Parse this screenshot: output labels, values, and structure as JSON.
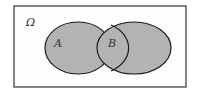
{
  "diagram": {
    "type": "venn",
    "universe_label": "Ω",
    "sets": [
      {
        "label": "A"
      },
      {
        "label": "B"
      }
    ],
    "colors": {
      "fill": "#b3b3b3",
      "stroke": "#1a1a1a",
      "frame": "#333333"
    }
  }
}
